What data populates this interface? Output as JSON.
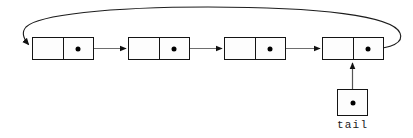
{
  "figure": {
    "kind": "circular-singly-linked-list",
    "background_color": "#ffffff",
    "stroke_color": "#141414",
    "connector_color": "#6e6e6e",
    "dot_color": "#000000",
    "node_fill": "#fdfdfd"
  },
  "nodes": [
    {
      "id": "node-1",
      "data_cell_text": "",
      "pointer_cell_text": "",
      "has_pointer_dot": true,
      "x": 32,
      "y": 37,
      "width": 62,
      "height": 23,
      "data_cell_width": 31
    },
    {
      "id": "node-2",
      "data_cell_text": "",
      "pointer_cell_text": "",
      "has_pointer_dot": true,
      "x": 128,
      "y": 37,
      "width": 62,
      "height": 23,
      "data_cell_width": 31
    },
    {
      "id": "node-3",
      "data_cell_text": "",
      "pointer_cell_text": "",
      "has_pointer_dot": true,
      "x": 224,
      "y": 37,
      "width": 62,
      "height": 23,
      "data_cell_width": 31
    },
    {
      "id": "node-4",
      "data_cell_text": "",
      "pointer_cell_text": "",
      "has_pointer_dot": true,
      "x": 322,
      "y": 37,
      "width": 62,
      "height": 23,
      "data_cell_width": 31
    }
  ],
  "pointer_variable": {
    "label": "tail",
    "box": {
      "x": 337,
      "y": 89,
      "width": 31,
      "height": 27
    },
    "label_position": {
      "x": 337,
      "y": 119,
      "width": 31
    },
    "has_dot": true,
    "points_to": "node-4"
  },
  "edges": [
    {
      "id": "edge-1-to-2",
      "from": "node-1",
      "to": "node-2",
      "kind": "straight-arrow"
    },
    {
      "id": "edge-2-to-3",
      "from": "node-2",
      "to": "node-3",
      "kind": "straight-arrow"
    },
    {
      "id": "edge-3-to-4",
      "from": "node-3",
      "to": "node-4",
      "kind": "straight-arrow"
    },
    {
      "id": "edge-4-to-1",
      "from": "node-4",
      "to": "node-1",
      "kind": "curved-wraparound-arrow"
    },
    {
      "id": "edge-tail-to-4",
      "from": "tail",
      "to": "node-4",
      "kind": "straight-arrow-up"
    }
  ]
}
